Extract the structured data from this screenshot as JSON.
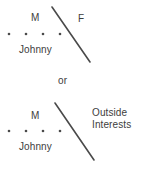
{
  "diagram": {
    "line_color": "#4a4a4a",
    "text_color": "#3d3d3d",
    "background": "#ffffff",
    "connector": "or",
    "groups": [
      {
        "id": "top",
        "male_label": "M",
        "partner_label": "F",
        "child_label": "Johnny",
        "sibling_dot_count": 4,
        "divider": {
          "x1": 52,
          "y1": 7,
          "x2": 90,
          "y2": 62
        }
      },
      {
        "id": "bottom",
        "male_label": "M",
        "partner_label": "Outside Interests",
        "partner_label_line1": "Outside",
        "partner_label_line2": "Interests",
        "child_label": "Johnny",
        "sibling_dot_count": 4,
        "divider": {
          "x1": 55,
          "y1": 103,
          "x2": 94,
          "y2": 160
        }
      }
    ],
    "dot_rows": [
      {
        "id": "top-dots",
        "y": 34,
        "xs": [
          9,
          26,
          43,
          60
        ]
      },
      {
        "id": "bottom-dots",
        "y": 131,
        "xs": [
          9,
          26,
          43,
          60
        ]
      }
    ]
  }
}
